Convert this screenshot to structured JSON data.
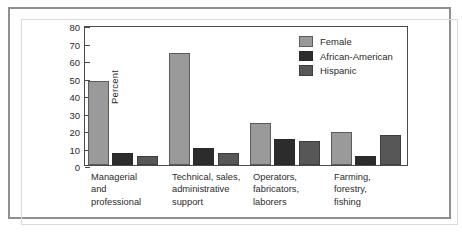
{
  "chart_data": {
    "type": "bar",
    "title": "",
    "xlabel": "",
    "ylabel": "Percent",
    "ylim": [
      0,
      80
    ],
    "ytick_step": 10,
    "yticks": [
      0,
      10,
      20,
      30,
      40,
      50,
      60,
      70,
      80
    ],
    "grid": false,
    "legend_position": "top-right",
    "categories": [
      "Managerial\nand\nprofessional",
      "Technical, sales,\nadministrative\nsupport",
      "Operators,\nfabricators,\nlaborers",
      "Farming,\nforestry,\nfishing"
    ],
    "series": [
      {
        "name": "Female",
        "color": "#9a9a9a",
        "values": [
          48,
          64,
          24,
          19
        ]
      },
      {
        "name": "African-American",
        "color": "#2c2c2c",
        "values": [
          7,
          10,
          15,
          5
        ]
      },
      {
        "name": "Hispanic",
        "color": "#575757",
        "values": [
          5,
          7,
          14,
          17
        ]
      }
    ]
  },
  "axis": {
    "y_title": "Percent",
    "tick_labels": [
      "80",
      "70",
      "60",
      "50",
      "40",
      "30",
      "20",
      "10",
      "0"
    ]
  },
  "legend": {
    "entries": [
      {
        "label": "Female",
        "color": "#9a9a9a"
      },
      {
        "label": "African-American",
        "color": "#2c2c2c"
      },
      {
        "label": "Hispanic",
        "color": "#575757"
      }
    ]
  },
  "colors": {
    "female": "#9a9a9a",
    "african_american": "#2c2c2c",
    "hispanic": "#575757",
    "axis": "#4a4a4a",
    "frame": "#8d8f91",
    "text": "#2b2b2b",
    "background": "#ffffff"
  }
}
